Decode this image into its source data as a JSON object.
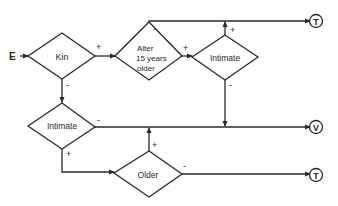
{
  "diagram": {
    "type": "flowchart",
    "entry_label": "E",
    "nodes": {
      "kin": {
        "label": "Kin"
      },
      "alter_older": {
        "label_lines": [
          "Alter",
          "15 years",
          "older"
        ]
      },
      "intimate_top": {
        "label": "Intimate"
      },
      "intimate_bottom": {
        "label": "Intimate"
      },
      "older": {
        "label": "Older"
      }
    },
    "terminals": {
      "t_top": {
        "label": "T"
      },
      "v_mid": {
        "label": "V"
      },
      "t_bottom": {
        "label": "T"
      }
    },
    "edge_labels": {
      "kin_plus": "+",
      "kin_minus": "-",
      "alter_plus": "+",
      "alter_minus": "-",
      "intimate_top_plus": "+",
      "intimate_top_minus": "-",
      "intimate_bottom_minus": "-",
      "intimate_bottom_plus": "+",
      "older_plus": "+",
      "older_minus": "-"
    },
    "colors": {
      "stroke": "#2a2a2a",
      "background": "#ffffff"
    }
  }
}
